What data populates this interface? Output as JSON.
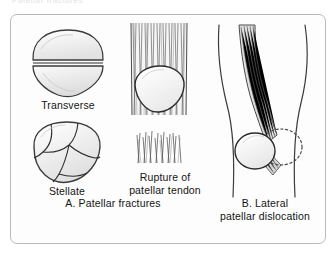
{
  "clipped_header": "Patellar fractures",
  "plate": {
    "items": [
      {
        "key": "transverse",
        "label": "Transverse"
      },
      {
        "key": "stellate",
        "label": "Stellate"
      },
      {
        "key": "rupture",
        "label": "Rupture of\npatellar tendon"
      }
    ],
    "panels": [
      {
        "key": "a",
        "label": "A. Patellar fractures"
      },
      {
        "key": "b",
        "label": "B. Lateral\npatellar dislocation"
      }
    ]
  },
  "colors": {
    "ink": "#1a1a1a",
    "outline": "#3b3b3b",
    "bone_fill": "#f2f2f2",
    "bone_shade": "#dcdcdc",
    "tendon": "#6e6e6e",
    "frame": "#b9b9b9",
    "page": "#ffffff"
  },
  "diagram": {
    "type": "medical-illustration",
    "figures": [
      {
        "name": "transverse-fracture",
        "description": "Anterior view of patella split by a single horizontal fracture line into superior and inferior fragments",
        "fracture_pattern": "transverse",
        "fragments": 2
      },
      {
        "name": "stellate-fracture",
        "description": "Anterior view of patella broken into multiple radiating fragments",
        "fracture_pattern": "stellate / comminuted",
        "fragments": 5
      },
      {
        "name": "patellar-tendon-rupture",
        "description": "Quadriceps fibres above patella with frayed, torn tendon stump separated below",
        "finding": "discontinuity of patellar tendon"
      },
      {
        "name": "lateral-patellar-dislocation",
        "description": "Frontal view of knee; patella displaced laterally (solid outline) with dotted outline marking normal midline position",
        "displacement": "lateral",
        "normal_position_marker": "dotted outline"
      }
    ]
  }
}
